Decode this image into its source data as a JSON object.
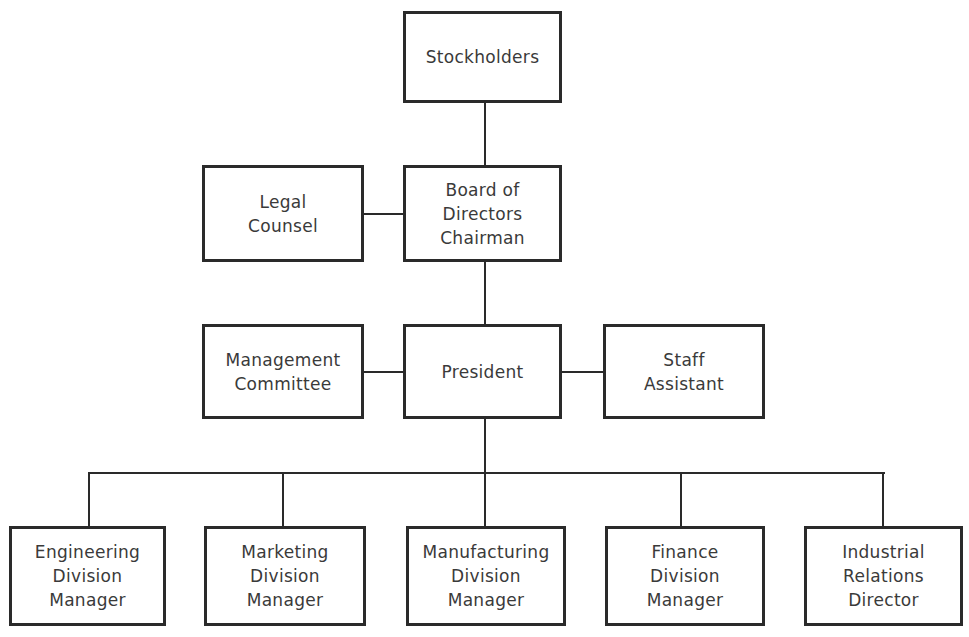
{
  "chart_title": "",
  "nodes": {
    "stockholders": {
      "lines": [
        "Stockholders"
      ]
    },
    "legal": {
      "lines": [
        "Legal",
        "Counsel"
      ]
    },
    "board": {
      "lines": [
        "Board of",
        "Directors",
        "Chairman"
      ]
    },
    "management": {
      "lines": [
        "Management",
        "Committee"
      ]
    },
    "president": {
      "lines": [
        "President"
      ]
    },
    "staff": {
      "lines": [
        "Staff",
        "Assistant"
      ]
    },
    "engineering": {
      "lines": [
        "Engineering",
        "Division",
        "Manager"
      ]
    },
    "marketing": {
      "lines": [
        "Marketing",
        "Division",
        "Manager"
      ]
    },
    "manufacturing": {
      "lines": [
        "Manufacturing",
        "Division",
        "Manager"
      ]
    },
    "finance": {
      "lines": [
        "Finance",
        "Division",
        "Manager"
      ]
    },
    "industrial": {
      "lines": [
        "Industrial",
        "Relations",
        "Director"
      ]
    }
  },
  "edges": [
    [
      "stockholders",
      "board"
    ],
    [
      "legal",
      "board"
    ],
    [
      "board",
      "president"
    ],
    [
      "management",
      "president"
    ],
    [
      "staff",
      "president"
    ],
    [
      "president",
      "engineering"
    ],
    [
      "president",
      "marketing"
    ],
    [
      "president",
      "manufacturing"
    ],
    [
      "president",
      "finance"
    ],
    [
      "president",
      "industrial"
    ]
  ]
}
